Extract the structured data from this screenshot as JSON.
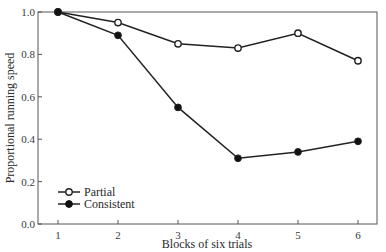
{
  "chart_data": {
    "type": "line",
    "title": "",
    "xlabel": "Blocks of six trials",
    "ylabel": "Proportional running speed",
    "x": [
      1,
      2,
      3,
      4,
      5,
      6
    ],
    "xticks": [
      "1",
      "2",
      "3",
      "4",
      "5",
      "6"
    ],
    "yticks": [
      "0.0",
      "0.2",
      "0.4",
      "0.6",
      "0.8",
      "1.0"
    ],
    "ylim": [
      0.0,
      1.0
    ],
    "xlim": [
      0.67,
      6.32
    ],
    "grid": false,
    "legend_position": "lower left",
    "series": [
      {
        "name": "Partial",
        "marker": "open-circle",
        "values": [
          1.0,
          0.95,
          0.85,
          0.83,
          0.9,
          0.77
        ]
      },
      {
        "name": "Consistent",
        "marker": "filled-circle",
        "values": [
          1.0,
          0.89,
          0.55,
          0.31,
          0.34,
          0.39
        ]
      }
    ]
  },
  "legend": {
    "items": [
      {
        "label": "Partial"
      },
      {
        "label": "Consistent"
      }
    ]
  },
  "colors": {
    "line": "#222222",
    "axis": "#555555",
    "background": "#ffffff"
  }
}
